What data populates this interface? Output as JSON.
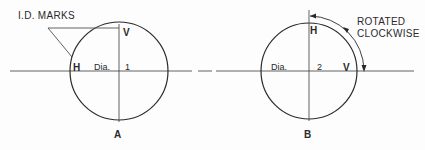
{
  "figure": {
    "colors": {
      "ink": "#2a2a2a",
      "background": "#fdfdfd"
    },
    "panel_a": {
      "caption": "A",
      "callout_label": "I.D. MARKS",
      "mark_top": "V",
      "mark_left": "H",
      "diameter_label": "Dia.",
      "diameter_number": "1"
    },
    "panel_b": {
      "caption": "B",
      "mark_top": "H",
      "mark_right": "V",
      "diameter_label": "Dia.",
      "diameter_number": "2",
      "rotation_label_line1": "ROTATED",
      "rotation_label_line2": "CLOCKWISE"
    }
  }
}
